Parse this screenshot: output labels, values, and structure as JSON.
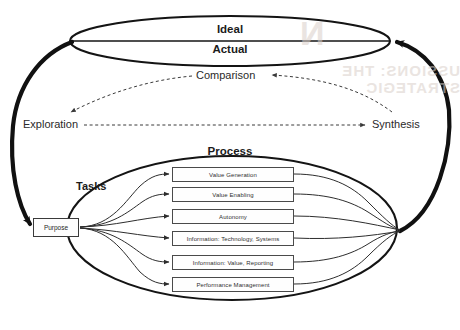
{
  "diagram": {
    "title_top_ellipse": {
      "upper_label": "Ideal",
      "lower_label": "Actual"
    },
    "cycle": {
      "nodes": [
        {
          "id": "comparison",
          "label": "Comparison"
        },
        {
          "id": "exploration",
          "label": "Exploration"
        },
        {
          "id": "synthesis",
          "label": "Synthesis"
        }
      ],
      "edges": [
        {
          "from": "comparison",
          "to": "exploration",
          "style": "dashed"
        },
        {
          "from": "exploration",
          "to": "synthesis",
          "style": "dashed"
        },
        {
          "from": "synthesis",
          "to": "comparison",
          "style": "dashed"
        }
      ]
    },
    "process": {
      "ellipse_label": "Process",
      "group_label": "Tasks",
      "source_node": "Purpose",
      "tasks": [
        "Value Generation",
        "Value Enabling",
        "Autonomy",
        "Information: Technology, Systems",
        "Information: Value, Reporting",
        "Performance Management"
      ]
    },
    "bleed_through": {
      "line1": "N",
      "line2": "USSIONS: THE STRATEGIC",
      "line3": "T",
      "line4": "scanned reverse page"
    },
    "colors": {
      "ink": "#1b1b1b",
      "line": "#2a2a2a",
      "box_border": "#4a4a4a",
      "background": "#ffffff",
      "bleed": "#d9cfc9"
    }
  }
}
